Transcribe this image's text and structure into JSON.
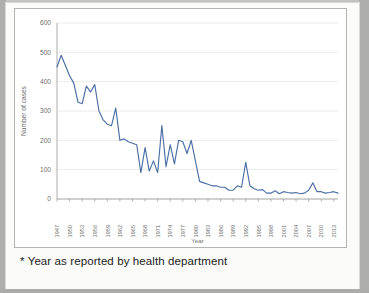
{
  "document": {
    "caption": "* Year as reported by health department"
  },
  "chart_data": {
    "type": "line",
    "title": "",
    "xlabel": "Year",
    "ylabel": "Number of cases",
    "ylim": [
      0,
      600
    ],
    "ytick_values": [
      0,
      100,
      200,
      300,
      400,
      500,
      600
    ],
    "ytick_labels": [
      "0",
      "100",
      "200",
      "300",
      "400",
      "500",
      "600"
    ],
    "xlim": [
      1947,
      2014
    ],
    "xtick_values": [
      1947,
      1950,
      1953,
      1956,
      1959,
      1962,
      1965,
      1968,
      1971,
      1974,
      1977,
      1980,
      1983,
      1986,
      1989,
      1992,
      1995,
      1998,
      2001,
      2004,
      2007,
      2010,
      2013
    ],
    "xtick_labels": [
      "1947",
      "1950",
      "1953",
      "1956",
      "1959",
      "1962",
      "1965",
      "1968",
      "1971",
      "1974",
      "1977",
      "1980",
      "1983",
      "1986",
      "1989",
      "1992",
      "1995",
      "1998",
      "2001",
      "2004",
      "2007",
      "2010",
      "2013"
    ],
    "grid": true,
    "legend": false,
    "line_color": "#4a6fa5",
    "series": [
      {
        "name": "Number of cases",
        "x": [
          1947,
          1948,
          1949,
          1950,
          1951,
          1952,
          1953,
          1954,
          1955,
          1956,
          1957,
          1958,
          1959,
          1960,
          1961,
          1962,
          1963,
          1964,
          1965,
          1966,
          1967,
          1968,
          1969,
          1970,
          1971,
          1972,
          1973,
          1974,
          1975,
          1976,
          1977,
          1978,
          1979,
          1980,
          1981,
          1982,
          1983,
          1984,
          1985,
          1986,
          1987,
          1988,
          1989,
          1990,
          1991,
          1992,
          1993,
          1994,
          1995,
          1996,
          1997,
          1998,
          1999,
          2000,
          2001,
          2002,
          2003,
          2004,
          2005,
          2006,
          2007,
          2008,
          2009,
          2010,
          2011,
          2012,
          2013,
          2014
        ],
        "values": [
          450,
          490,
          455,
          420,
          395,
          330,
          325,
          385,
          365,
          390,
          300,
          270,
          255,
          250,
          310,
          200,
          205,
          195,
          190,
          185,
          90,
          175,
          95,
          130,
          90,
          250,
          110,
          185,
          120,
          200,
          195,
          155,
          200,
          130,
          60,
          55,
          50,
          45,
          45,
          40,
          40,
          30,
          30,
          45,
          40,
          125,
          45,
          35,
          30,
          32,
          20,
          20,
          28,
          18,
          25,
          22,
          20,
          22,
          18,
          20,
          30,
          55,
          25,
          25,
          20,
          22,
          25,
          20
        ]
      }
    ]
  }
}
